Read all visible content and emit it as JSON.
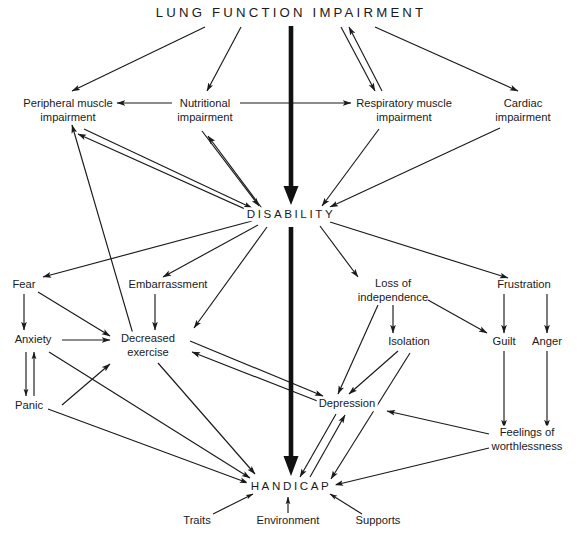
{
  "figure": {
    "title": "LUNG FUNCTION IMPAIRMENT",
    "type": "flow-diagram",
    "background_color": "#ffffff",
    "line_color": "#1a1a1a",
    "text_color": "#1a1a1a"
  },
  "nodes": {
    "lung_function_impairment": {
      "label": "LUNG FUNCTION IMPAIRMENT",
      "x": 291,
      "y": 13,
      "style": "title"
    },
    "peripheral_muscle_impairment": {
      "label": "Peripheral muscle\nimpairment",
      "x": 68,
      "y": 110,
      "style": "normal"
    },
    "nutritional_impairment": {
      "label": "Nutritional\nimpairment",
      "x": 205,
      "y": 110,
      "style": "normal"
    },
    "respiratory_muscle_impairment": {
      "label": "Respiratory muscle\nimpairment",
      "x": 404,
      "y": 110,
      "style": "normal"
    },
    "cardiac_impairment": {
      "label": "Cardiac\nimpairment",
      "x": 523,
      "y": 110,
      "style": "normal"
    },
    "disability": {
      "label": "DISABILITY",
      "x": 291,
      "y": 214,
      "style": "major"
    },
    "fear": {
      "label": "Fear",
      "x": 24,
      "y": 285,
      "style": "normal"
    },
    "embarrassment": {
      "label": "Embarrassment",
      "x": 168,
      "y": 285,
      "style": "normal"
    },
    "loss_of_independence": {
      "label": "Loss of\nindependence",
      "x": 393,
      "y": 290,
      "style": "normal"
    },
    "frustration": {
      "label": "Frustration",
      "x": 524,
      "y": 285,
      "style": "normal"
    },
    "anxiety": {
      "label": "Anxiety",
      "x": 33,
      "y": 340,
      "style": "normal"
    },
    "decreased_exercise": {
      "label": "Decreased\nexercise",
      "x": 148,
      "y": 345,
      "style": "normal"
    },
    "isolation": {
      "label": "Isolation",
      "x": 409,
      "y": 342,
      "style": "normal"
    },
    "guilt": {
      "label": "Guilt",
      "x": 504,
      "y": 342,
      "style": "normal"
    },
    "anger": {
      "label": "Anger",
      "x": 547,
      "y": 342,
      "style": "normal"
    },
    "panic": {
      "label": "Panic",
      "x": 29,
      "y": 406,
      "style": "normal"
    },
    "depression": {
      "label": "Depression",
      "x": 347,
      "y": 404,
      "style": "normal"
    },
    "feelings_of_worthlessness": {
      "label": "Feelings of\nworthlessness",
      "x": 527,
      "y": 439,
      "style": "normal"
    },
    "handicap": {
      "label": "HANDICAP",
      "x": 291,
      "y": 486,
      "style": "major"
    },
    "traits": {
      "label": "Traits",
      "x": 197,
      "y": 521,
      "style": "normal"
    },
    "environment": {
      "label": "Environment",
      "x": 288,
      "y": 521,
      "style": "normal"
    },
    "supports": {
      "label": "Supports",
      "x": 378,
      "y": 521,
      "style": "normal"
    }
  },
  "edges": [
    {
      "from": "lung_function_impairment",
      "to": "peripheral_muscle_impairment",
      "kind": "single"
    },
    {
      "from": "lung_function_impairment",
      "to": "nutritional_impairment",
      "kind": "single"
    },
    {
      "from": "lung_function_impairment",
      "to": "respiratory_muscle_impairment",
      "kind": "double"
    },
    {
      "from": "lung_function_impairment",
      "to": "cardiac_impairment",
      "kind": "single"
    },
    {
      "from": "lung_function_impairment",
      "to": "disability",
      "kind": "thick"
    },
    {
      "from": "nutritional_impairment",
      "to": "peripheral_muscle_impairment",
      "kind": "single"
    },
    {
      "from": "nutritional_impairment",
      "to": "respiratory_muscle_impairment",
      "kind": "single"
    },
    {
      "from": "peripheral_muscle_impairment",
      "to": "disability",
      "kind": "double"
    },
    {
      "from": "nutritional_impairment",
      "to": "disability",
      "kind": "double"
    },
    {
      "from": "respiratory_muscle_impairment",
      "to": "disability",
      "kind": "single"
    },
    {
      "from": "cardiac_impairment",
      "to": "disability",
      "kind": "single"
    },
    {
      "from": "disability",
      "to": "fear",
      "kind": "single"
    },
    {
      "from": "disability",
      "to": "embarrassment",
      "kind": "single"
    },
    {
      "from": "disability",
      "to": "decreased_exercise",
      "kind": "single"
    },
    {
      "from": "disability",
      "to": "loss_of_independence",
      "kind": "single"
    },
    {
      "from": "disability",
      "to": "frustration",
      "kind": "single"
    },
    {
      "from": "disability",
      "to": "handicap",
      "kind": "thick"
    },
    {
      "from": "disability",
      "to": "peripheral_muscle_impairment",
      "kind": "return"
    },
    {
      "from": "fear",
      "to": "anxiety",
      "kind": "single"
    },
    {
      "from": "fear",
      "to": "decreased_exercise",
      "kind": "single"
    },
    {
      "from": "embarrassment",
      "to": "decreased_exercise",
      "kind": "single"
    },
    {
      "from": "anxiety",
      "to": "decreased_exercise",
      "kind": "single"
    },
    {
      "from": "anxiety",
      "to": "panic",
      "kind": "bidirectional-vertical"
    },
    {
      "from": "panic",
      "to": "decreased_exercise",
      "kind": "single"
    },
    {
      "from": "anxiety",
      "to": "handicap",
      "kind": "single"
    },
    {
      "from": "panic",
      "to": "handicap",
      "kind": "single"
    },
    {
      "from": "decreased_exercise",
      "to": "handicap",
      "kind": "single"
    },
    {
      "from": "decreased_exercise",
      "to": "depression",
      "kind": "double"
    },
    {
      "from": "loss_of_independence",
      "to": "isolation",
      "kind": "single"
    },
    {
      "from": "loss_of_independence",
      "to": "depression",
      "kind": "single"
    },
    {
      "from": "loss_of_independence",
      "to": "guilt",
      "kind": "single"
    },
    {
      "from": "isolation",
      "to": "depression",
      "kind": "single"
    },
    {
      "from": "isolation",
      "to": "handicap",
      "kind": "single"
    },
    {
      "from": "frustration",
      "to": "guilt",
      "kind": "single"
    },
    {
      "from": "frustration",
      "to": "anger",
      "kind": "single"
    },
    {
      "from": "guilt",
      "to": "feelings_of_worthlessness",
      "kind": "single"
    },
    {
      "from": "anger",
      "to": "feelings_of_worthlessness",
      "kind": "single"
    },
    {
      "from": "feelings_of_worthlessness",
      "to": "depression",
      "kind": "single"
    },
    {
      "from": "feelings_of_worthlessness",
      "to": "handicap",
      "kind": "single"
    },
    {
      "from": "depression",
      "to": "handicap",
      "kind": "double"
    },
    {
      "from": "traits",
      "to": "handicap",
      "kind": "single"
    },
    {
      "from": "environment",
      "to": "handicap",
      "kind": "single"
    },
    {
      "from": "supports",
      "to": "handicap",
      "kind": "single"
    }
  ]
}
